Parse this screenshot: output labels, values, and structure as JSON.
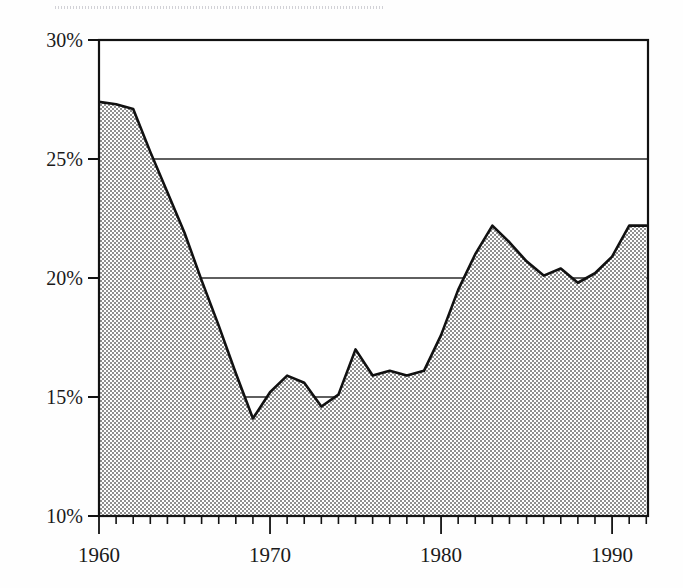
{
  "chart_data": {
    "type": "area",
    "title": "",
    "subtitle": "",
    "xlabel": "",
    "ylabel": "",
    "xlim": [
      1960,
      1992.1
    ],
    "ylim": [
      10,
      30
    ],
    "grid": true,
    "grid_axis": "y",
    "legend": "none",
    "y_tick_labels": [
      "30%",
      "25%",
      "20%",
      "15%",
      "10%"
    ],
    "y_ticks": [
      30,
      25,
      20,
      15,
      10
    ],
    "x_tick_labels": [
      "1960",
      "1970",
      "1980",
      "1990"
    ],
    "x_ticks": [
      1960,
      1970,
      1980,
      1990
    ],
    "x_minor_tick_interval": 1,
    "series": [
      {
        "name": "share",
        "units": "percent",
        "fill": "halftone-gray",
        "x": [
          1960,
          1961,
          1962,
          1963,
          1964,
          1965,
          1966,
          1967,
          1968,
          1969,
          1970,
          1971,
          1972,
          1973,
          1974,
          1975,
          1976,
          1977,
          1978,
          1979,
          1980,
          1981,
          1982,
          1983,
          1984,
          1985,
          1986,
          1987,
          1988,
          1989,
          1990,
          1991,
          1992
        ],
        "values": [
          27.4,
          27.3,
          27.1,
          25.3,
          23.6,
          21.9,
          19.9,
          18.0,
          16.0,
          14.1,
          15.2,
          15.9,
          15.6,
          14.6,
          15.1,
          17.0,
          15.9,
          16.1,
          15.9,
          16.1,
          17.6,
          19.5,
          21.0,
          22.2,
          21.5,
          20.7,
          20.1,
          20.4,
          19.8,
          20.2,
          20.9,
          22.2,
          22.2
        ]
      }
    ],
    "annotations": []
  },
  "axes": {
    "y_axis_label_count": 5,
    "x_axis_label_count": 4
  },
  "colors": {
    "axis": "#121212",
    "gridline": "#2a2a2a",
    "series_line": "#111111",
    "series_fill": "#a8a8a8",
    "background": "#ffffff",
    "text": "#1a1a1a"
  }
}
